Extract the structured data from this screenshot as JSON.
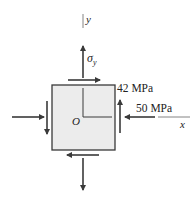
{
  "diagram": {
    "type": "stress-element",
    "axes": {
      "x_label": "x",
      "y_label": "y",
      "origin_label": "O"
    },
    "stresses": {
      "normal_y_label": "σ",
      "normal_y_subscript": "y",
      "shear_label": "42 MPa",
      "normal_x_label": "50 MPa"
    },
    "colors": {
      "element_fill": "#ececec",
      "stroke": "#3a3a3a",
      "axis": "#555555"
    }
  }
}
